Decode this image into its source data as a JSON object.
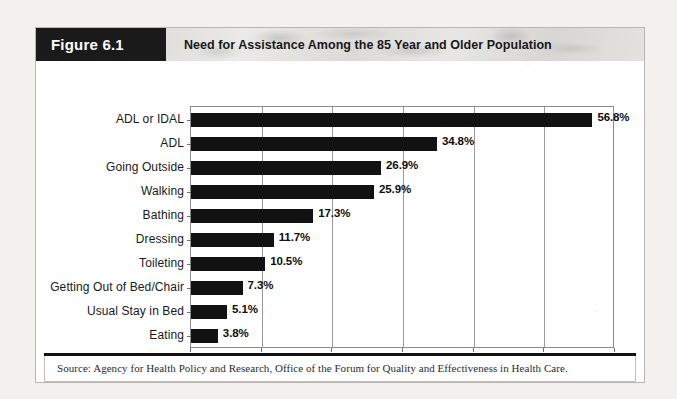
{
  "figure": {
    "tag": "Figure 6.1",
    "title": "Need for Assistance Among the 85 Year and Older Population",
    "source": "Source: Agency for Health Policy and Research, Office of the Forum for Quality and Effectiveness in Health Care."
  },
  "chart_data": {
    "type": "bar",
    "orientation": "horizontal",
    "title": "Need for Assistance Among the 85 Year and Older Population",
    "xlabel": "",
    "ylabel": "",
    "xlim": [
      0,
      60
    ],
    "xticks": [
      "0",
      "10",
      "20",
      "30",
      "40",
      "50",
      "60"
    ],
    "grid": "vertical",
    "legend": "none",
    "bar_color": "#121212",
    "value_suffix": "%",
    "categories": [
      "ADL or IDAL",
      "ADL",
      "Going Outside",
      "Walking",
      "Bathing",
      "Dressing",
      "Toileting",
      "Getting Out of Bed/Chair",
      "Usual Stay in Bed",
      "Eating"
    ],
    "values": [
      56.8,
      34.8,
      26.9,
      25.9,
      17.3,
      11.7,
      10.5,
      7.3,
      5.1,
      3.8
    ],
    "value_labels": [
      "56.8%",
      "34.8%",
      "26.9%",
      "25.9%",
      "17.3%",
      "11.7%",
      "10.5%",
      "7.3%",
      "5.1%",
      "3.8%"
    ]
  }
}
